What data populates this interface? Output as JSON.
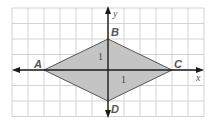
{
  "diagram": {
    "type": "coordinate-plane",
    "shape": "rhombus",
    "grid": {
      "x_min_px": 12,
      "x_max_px": 204,
      "y_min_px": 8,
      "y_max_px": 117,
      "step_x_px": 16,
      "step_y_px": 15.5
    },
    "origin_px": [
      108,
      70
    ],
    "axes": {
      "x_label": "x",
      "y_label": "y"
    },
    "tick_labels": {
      "x_unit": "1",
      "y_unit": "1"
    },
    "vertices": [
      {
        "name": "A",
        "coord": [
          -4,
          0
        ]
      },
      {
        "name": "B",
        "coord": [
          0,
          2
        ]
      },
      {
        "name": "C",
        "coord": [
          4,
          0
        ]
      },
      {
        "name": "D",
        "coord": [
          0,
          -2
        ]
      }
    ],
    "colors": {
      "grid": "#c8c8c8",
      "axis": "#1a1a1a",
      "fill": "#c4c4c4",
      "stroke": "#555555",
      "label": "#555555"
    }
  }
}
